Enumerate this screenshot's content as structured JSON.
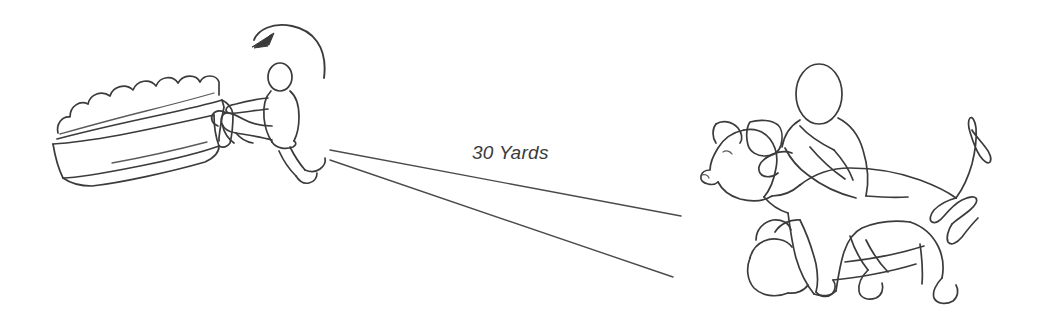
{
  "illustration": {
    "title": "Dog training distance diagram",
    "background_color": "#ffffff",
    "stroke_color": "#3b3b3b",
    "label_color": "#3a3a3a"
  },
  "annotations": {
    "distance_label": "30 Yards"
  },
  "elements": {
    "left_scene_name": "running-person-behind-hedge-wall",
    "right_scene_name": "kneeling-handler-restraining-dog",
    "arrow_name": "curved-direction-arrow",
    "sightlines_name": "diverging-sight-lines"
  }
}
